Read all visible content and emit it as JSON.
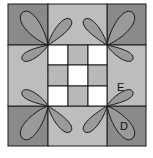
{
  "diagram": {
    "type": "quilt-block",
    "colors": {
      "corner": "#8a8a8a",
      "side": "#bdbdbd",
      "center_white": "#ffffff",
      "center_gray": "#b8b8b8",
      "petal": "#9a9a9a",
      "line": "#1a1a1a"
    },
    "labels": {
      "E": "E",
      "D": "D"
    }
  }
}
